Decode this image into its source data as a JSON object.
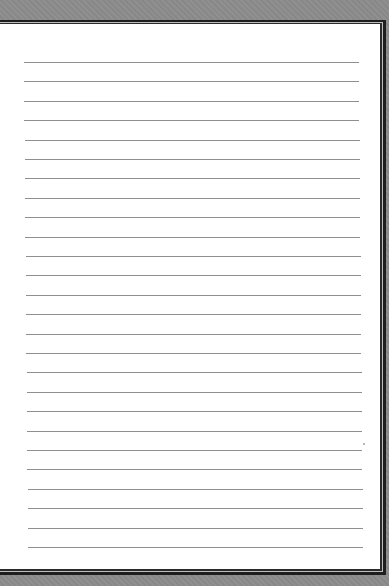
{
  "page": {
    "type": "lined-notebook-paper",
    "background_color": "#8a8a8a",
    "paper_color": "#ffffff",
    "rule_color": "#8f8f8f",
    "frame_color": "#1e1e1e"
  },
  "rules": {
    "count": 26,
    "first_y": 62,
    "spacing": 19.4,
    "left_start": 24,
    "left_end": 28,
    "right_start": 359,
    "right_end": 363
  }
}
